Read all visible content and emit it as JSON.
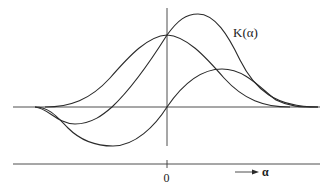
{
  "diagram": {
    "curve_label": "K(α)",
    "origin_label": "0",
    "axis_label": "α",
    "curves": [
      {
        "name": "symmetric-bell",
        "description": "symmetric bell curve peaking at origin"
      },
      {
        "name": "K-alpha",
        "description": "skewed curve with negative lobe left, peak right of origin",
        "label": "K(α)"
      },
      {
        "name": "odd-curve",
        "description": "antisymmetric-like curve, negative left of origin, positive right"
      }
    ]
  },
  "colors": {
    "stroke": "#2a2a2a",
    "background": "#ffffff"
  }
}
